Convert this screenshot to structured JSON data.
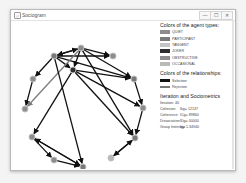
{
  "window": {
    "title": "Sociogram",
    "app_icon": "sociogram-app-icon",
    "controls": {
      "minimize": "—",
      "maximize": "☐",
      "close": "✕"
    }
  },
  "legend": {
    "agent_types_title": "Colors of the agent types:",
    "agent_types": [
      {
        "label": "QUIET",
        "color": "#8c8c8c"
      },
      {
        "label": "PARTICIPANT",
        "color": "#7a7a7a"
      },
      {
        "label": "TANGENT",
        "color": "#c4c4c4"
      },
      {
        "label": "JOKER",
        "color": "#2e2e2e"
      },
      {
        "label": "OBSTRUCTIVE",
        "color": "#8e8e8e"
      },
      {
        "label": "OCCASIONAL",
        "color": "#b9b9b9"
      }
    ],
    "relationships_title": "Colors of the relationships:",
    "relationships": [
      {
        "label": "Selection",
        "color": "#111111"
      },
      {
        "label": "Rejection",
        "color": "#777777"
      }
    ],
    "stats_title": "Iteration and Sociometrics",
    "iteration_label": "Iteration: 40",
    "stats": [
      {
        "label": "Cohesion:",
        "value": "Ikg= 12137"
      },
      {
        "label": "Coherence:",
        "value": "ICg= 89860"
      },
      {
        "label": "Dissociation:",
        "value": "IDg= 00000"
      },
      {
        "label": "Group Intensity:",
        "value": "Ig= 1.34940"
      }
    ]
  },
  "graph": {
    "node_color": "#9a9a9a",
    "selection_color": "#111111",
    "rejection_color": "#7d7d7d",
    "nodes": [
      {
        "id": "n1",
        "type": "PARTICIPANT"
      },
      {
        "id": "n2",
        "type": "QUIET"
      },
      {
        "id": "n3",
        "type": "QUIET"
      },
      {
        "id": "n4",
        "type": "PARTICIPANT"
      },
      {
        "id": "n5",
        "type": "JOKER"
      },
      {
        "id": "n6",
        "type": "QUIET"
      },
      {
        "id": "n7",
        "type": "OBSTRUCTIVE"
      },
      {
        "id": "n8",
        "type": "QUIET"
      },
      {
        "id": "n9",
        "type": "PARTICIPANT"
      },
      {
        "id": "n10",
        "type": "QUIET"
      },
      {
        "id": "n11",
        "type": "PARTICIPANT"
      },
      {
        "id": "n12",
        "type": "OCCASIONAL"
      },
      {
        "id": "n13",
        "type": "QUIET"
      }
    ],
    "edges": [
      {
        "from": "n1",
        "to": "n2",
        "kind": "selection"
      },
      {
        "from": "n2",
        "to": "n1",
        "kind": "selection"
      },
      {
        "from": "n1",
        "to": "n3",
        "kind": "selection"
      },
      {
        "from": "n2",
        "to": "n3",
        "kind": "selection"
      },
      {
        "from": "n2",
        "to": "n4",
        "kind": "selection"
      },
      {
        "from": "n1",
        "to": "n4",
        "kind": "selection"
      },
      {
        "from": "n5",
        "to": "n4",
        "kind": "selection"
      },
      {
        "from": "n2",
        "to": "n5",
        "kind": "selection"
      },
      {
        "from": "n1",
        "to": "n5",
        "kind": "selection"
      },
      {
        "from": "n1",
        "to": "n6",
        "kind": "selection"
      },
      {
        "from": "n6",
        "to": "n7",
        "kind": "selection"
      },
      {
        "from": "n2",
        "to": "n7",
        "kind": "rejection"
      },
      {
        "from": "n5",
        "to": "n8",
        "kind": "selection"
      },
      {
        "from": "n4",
        "to": "n8",
        "kind": "selection"
      },
      {
        "from": "n8",
        "to": "n9",
        "kind": "selection"
      },
      {
        "from": "n2",
        "to": "n9",
        "kind": "selection"
      },
      {
        "from": "n5",
        "to": "n9",
        "kind": "selection"
      },
      {
        "from": "n5",
        "to": "n10",
        "kind": "selection"
      },
      {
        "from": "n1",
        "to": "n11",
        "kind": "selection"
      },
      {
        "from": "n10",
        "to": "n11",
        "kind": "selection"
      },
      {
        "from": "n10",
        "to": "n13",
        "kind": "selection"
      },
      {
        "from": "n13",
        "to": "n11",
        "kind": "selection"
      },
      {
        "from": "n11",
        "to": "n10",
        "kind": "selection"
      },
      {
        "from": "n9",
        "to": "n12",
        "kind": "selection"
      },
      {
        "from": "n12",
        "to": "n9",
        "kind": "selection"
      }
    ]
  }
}
